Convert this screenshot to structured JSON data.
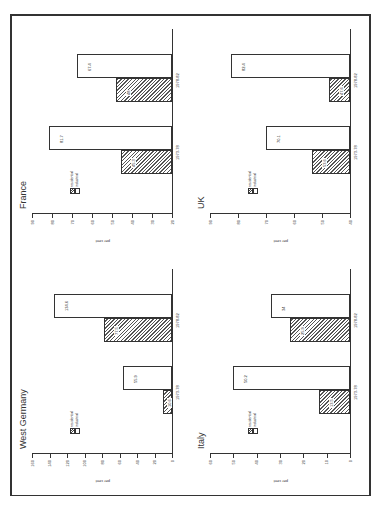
{
  "legend": {
    "residential": "residential",
    "industrial": "industrial"
  },
  "ylabel": "per cent",
  "categories": [
    "1973-78",
    "1978-82"
  ],
  "chart_data": [
    {
      "type": "bar",
      "title": "West Germany",
      "ylabel": "per cent",
      "categories": [
        "1973-78",
        "1978-82"
      ],
      "series": [
        {
          "name": "residential",
          "values": [
            10.6,
            77.5
          ]
        },
        {
          "name": "industrial",
          "values": [
            55.9,
            134.6
          ]
        }
      ],
      "ylim": [
        0,
        160
      ],
      "yticks": [
        0,
        20,
        40,
        60,
        80,
        100,
        120,
        140,
        160
      ],
      "legend_position": "inside-left",
      "grid": false
    },
    {
      "type": "bar",
      "title": "France",
      "ylabel": "per cent",
      "categories": [
        "1973-78",
        "1978-82"
      ],
      "series": [
        {
          "name": "residential",
          "values": [
            45.3,
            48
          ]
        },
        {
          "name": "industrial",
          "values": [
            81.7,
            67.4
          ]
        }
      ],
      "ylim": [
        20,
        90
      ],
      "yticks": [
        20,
        30,
        40,
        50,
        60,
        70,
        80,
        90
      ],
      "legend_position": "inside-left",
      "grid": false
    },
    {
      "type": "bar",
      "title": "Italy",
      "ylabel": "per cent",
      "categories": [
        "1973-78",
        "1978-82"
      ],
      "series": [
        {
          "name": "residential",
          "values": [
            13.5,
            25.9
          ]
        },
        {
          "name": "industrial",
          "values": [
            50.2,
            34
          ]
        }
      ],
      "ylim": [
        0,
        60
      ],
      "yticks": [
        0,
        10,
        20,
        30,
        40,
        50,
        60
      ],
      "legend_position": "inside-left",
      "grid": false
    },
    {
      "type": "bar",
      "title": "UK",
      "ylabel": "per cent",
      "categories": [
        "1973-78",
        "1978-82"
      ],
      "series": [
        {
          "name": "residential",
          "values": [
            53.6,
            47.6
          ]
        },
        {
          "name": "industrial",
          "values": [
            70.1,
            82.4
          ]
        }
      ],
      "ylim": [
        40,
        90
      ],
      "yticks": [
        40,
        50,
        60,
        70,
        80,
        90
      ],
      "legend_position": "inside-left",
      "grid": false
    }
  ],
  "panels": {
    "wg": {
      "title": "West Germany",
      "res": [
        "10.6",
        "77.5"
      ],
      "ind": [
        "55.9",
        "134.6"
      ]
    },
    "fr": {
      "title": "France",
      "res": [
        "45.3",
        "48"
      ],
      "ind": [
        "81.7",
        "67.4"
      ]
    },
    "it": {
      "title": "Italy",
      "res": [
        "13.5",
        "25.9"
      ],
      "ind": [
        "50.2",
        "34"
      ]
    },
    "uk": {
      "title": "UK",
      "res": [
        "53.6",
        "47.6"
      ],
      "ind": [
        "70.1",
        "82.4"
      ]
    }
  }
}
